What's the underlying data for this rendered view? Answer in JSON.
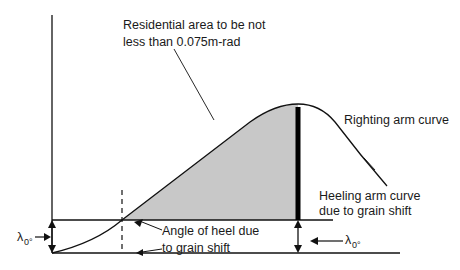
{
  "diagram": {
    "labels": {
      "residual_line1": "Residential area to be not",
      "residual_line2": "less than 0.075m-rad",
      "righting": "Righting arm curve",
      "heeling_line1": "Heeling arm curve",
      "heeling_line2": "due to grain shift",
      "angle_line1": "Angle of heel due",
      "angle_line2": "to grain shift",
      "lambda_symbol": "λ",
      "lambda_sub": "0°"
    },
    "colors": {
      "line": "#111111",
      "shaded_area": "#c8c8c8",
      "background": "#ffffff"
    }
  }
}
